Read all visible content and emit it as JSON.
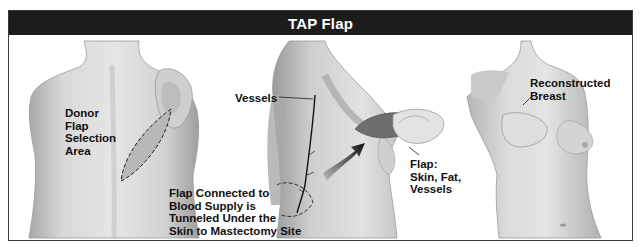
{
  "title": "TAP Flap",
  "panels": [
    {
      "name": "back-donor-site",
      "labels": {
        "donor": "Donor\nFlap\nSelection\nArea"
      }
    },
    {
      "name": "side-tunneling",
      "labels": {
        "vessels": "Vessels",
        "tunnel": "Flap Connected to\nBlood Supply is\nTunneled Under the\nSkin to Mastectomy Site",
        "flap": "Flap:\nSkin, Fat,\nVessels"
      }
    },
    {
      "name": "front-result",
      "labels": {
        "reconstructed": "Reconstructed\nBreast"
      }
    }
  ],
  "colors": {
    "title_bar": "#1c1c1c",
    "skin_light": "#d9d9d9",
    "skin_mid": "#bdbdbd",
    "skin_dark": "#8f8f8f",
    "flap_dark": "#6e6e6e"
  }
}
